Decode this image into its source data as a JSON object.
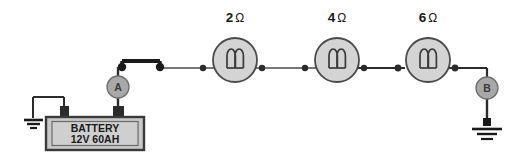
{
  "diagram": {
    "background_color": "#ffffff",
    "wire_color": "#1a1a1a",
    "lamp_fill": "#d4d4d4",
    "lamp_stroke": "#4a4a4a",
    "node_fill": "#a8a8a8",
    "node_stroke": "#6e6e6e",
    "battery_body_fill": "#c9c9c9",
    "battery_border": "#3a3a3a",
    "terminal_fill": "#2b2b2b"
  },
  "battery": {
    "name_label": "BATTERY",
    "rating_label": "12V 60AH",
    "voltage": "12V",
    "capacity": "60AH"
  },
  "switch": {
    "label": "",
    "state": "closed"
  },
  "test_points": [
    {
      "id": "A",
      "label": "A",
      "position": "between-battery-positive-and-switch"
    },
    {
      "id": "B",
      "label": "B",
      "position": "after-third-lamp-to-ground"
    }
  ],
  "lamps": [
    {
      "id": "lamp-1",
      "resistance_value": "2",
      "ohm_symbol": "Ω",
      "label": "2 Ω"
    },
    {
      "id": "lamp-2",
      "resistance_value": "4",
      "ohm_symbol": "Ω",
      "label": "4 Ω"
    },
    {
      "id": "lamp-3",
      "resistance_value": "6",
      "ohm_symbol": "Ω",
      "label": "6 Ω"
    }
  ],
  "grounds": [
    {
      "id": "ground-left",
      "label": "",
      "attached_to": "battery-negative"
    },
    {
      "id": "ground-right",
      "label": "",
      "attached_to": "test-point-B"
    }
  ]
}
